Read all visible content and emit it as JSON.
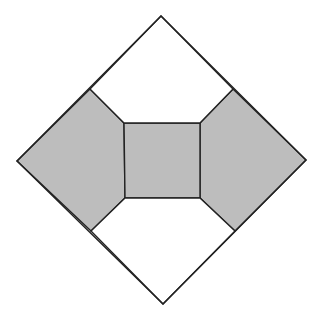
{
  "figure": {
    "canvas": {
      "width": 320,
      "height": 318
    },
    "colors": {
      "background": "#ffffff",
      "shaded_fill": "#bdbdbd",
      "white_fill": "#ffffff",
      "stroke": "#222222"
    },
    "stroke_width": 1.4,
    "outer_diamond": {
      "top": [
        161,
        16
      ],
      "right": [
        306,
        160
      ],
      "bottom": [
        163,
        304
      ],
      "left": [
        17,
        161
      ]
    },
    "central_square": {
      "top_left": [
        124,
        123
      ],
      "top_right": [
        200,
        123
      ],
      "bottom_right": [
        200,
        198
      ],
      "bottom_left": [
        125,
        198
      ],
      "shaded": true
    },
    "edge_junctions": {
      "upper_left": [
        90,
        89
      ],
      "upper_right": [
        233,
        89
      ],
      "lower_right": [
        235,
        231
      ],
      "lower_left": [
        91,
        231
      ]
    },
    "regions": [
      {
        "name": "left-pentagon",
        "shaded": true,
        "points": [
          [
            17,
            161
          ],
          [
            90,
            89
          ],
          [
            124,
            123
          ],
          [
            125,
            198
          ],
          [
            91,
            231
          ]
        ]
      },
      {
        "name": "right-pentagon",
        "shaded": true,
        "points": [
          [
            306,
            160
          ],
          [
            233,
            89
          ],
          [
            200,
            123
          ],
          [
            200,
            198
          ],
          [
            235,
            231
          ]
        ]
      },
      {
        "name": "central-square",
        "shaded": true,
        "points": [
          [
            124,
            123
          ],
          [
            200,
            123
          ],
          [
            200,
            198
          ],
          [
            125,
            198
          ]
        ]
      },
      {
        "name": "top-region",
        "shaded": false,
        "points": [
          [
            161,
            16
          ],
          [
            233,
            89
          ],
          [
            200,
            123
          ],
          [
            124,
            123
          ],
          [
            90,
            89
          ]
        ]
      },
      {
        "name": "bottom-region",
        "shaded": false,
        "points": [
          [
            163,
            304
          ],
          [
            235,
            231
          ],
          [
            200,
            198
          ],
          [
            125,
            198
          ],
          [
            91,
            231
          ]
        ]
      }
    ]
  }
}
